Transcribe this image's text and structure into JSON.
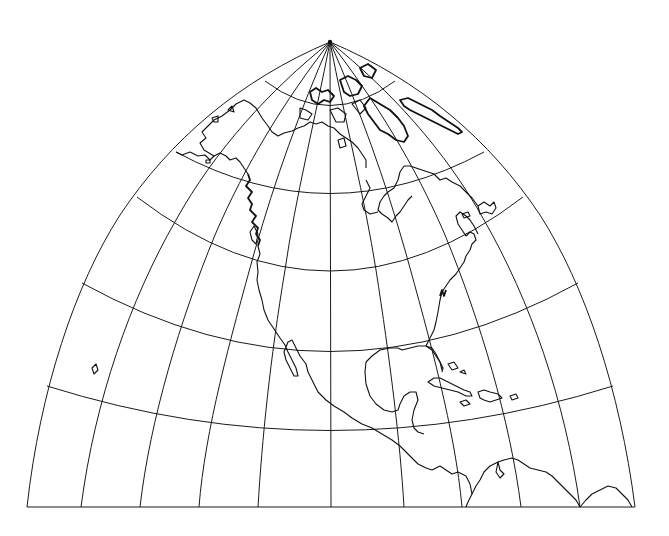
{
  "map": {
    "title": "North America graticule map (pole-centered conic/polyconic projection)",
    "projection": "pole-centered, North Pole at top apex",
    "colors": {
      "background": "#ffffff",
      "lines": "#111111"
    },
    "pole": {
      "x": 330,
      "y": 42
    },
    "graticule": {
      "parallels_deg": [
        80,
        70,
        60,
        50,
        40,
        30
      ],
      "meridian_count": 11,
      "bottom_edge_y": 507,
      "bottom_edge_x_range": [
        27,
        635
      ]
    },
    "regions_shown": [
      "Alaska",
      "Canadian Arctic Archipelago",
      "Greenland (southwest coast)",
      "Hudson Bay",
      "Labrador",
      "Newfoundland",
      "Pacific Northwest coast",
      "Baja California",
      "Mexico",
      "Gulf of Mexico",
      "Florida",
      "Cuba",
      "Hispaniola",
      "Puerto Rico",
      "Jamaica",
      "Central America",
      "Northern South America (Venezuela, Colombia)",
      "Hawaii (island)"
    ]
  }
}
